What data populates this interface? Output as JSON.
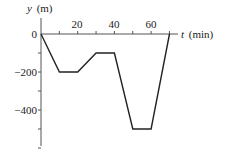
{
  "chart_data": {
    "type": "line",
    "title": "",
    "xlabel": "t (min)",
    "ylabel": "y (m)",
    "xlabel_var": "t",
    "xlabel_unit": "(min)",
    "ylabel_var": "y",
    "ylabel_unit": "(m)",
    "x_ticks": [
      10,
      20,
      30,
      40,
      50,
      60,
      70
    ],
    "x_tick_labels": [
      "20",
      "40",
      "60"
    ],
    "x_tick_label_values": [
      20,
      40,
      60
    ],
    "y_ticks": [
      0,
      -100,
      -200,
      -300,
      -400,
      -500,
      -600
    ],
    "y_tick_labels": [
      "0",
      "-200",
      "-400"
    ],
    "y_tick_label_values": [
      0,
      -200,
      -400
    ],
    "xlim": [
      0,
      76
    ],
    "ylim": [
      -600,
      40
    ],
    "grid": false,
    "legend": null,
    "series": [
      {
        "name": "y(t)",
        "x": [
          0,
          10,
          20,
          30,
          40,
          50,
          60,
          70
        ],
        "y": [
          0,
          -200,
          -200,
          -100,
          -100,
          -500,
          -500,
          0
        ]
      }
    ]
  },
  "labels": {
    "y_axis_var": "y",
    "y_axis_unit": "(m)",
    "x_axis_var": "t",
    "x_axis_unit": "(min)",
    "zero": "0",
    "x20": "20",
    "x40": "40",
    "x60": "60",
    "y_neg200": "−200",
    "y_neg400": "−400"
  },
  "colors": {
    "axis": "#555555",
    "line": "#222222",
    "background": "#ffffff"
  }
}
